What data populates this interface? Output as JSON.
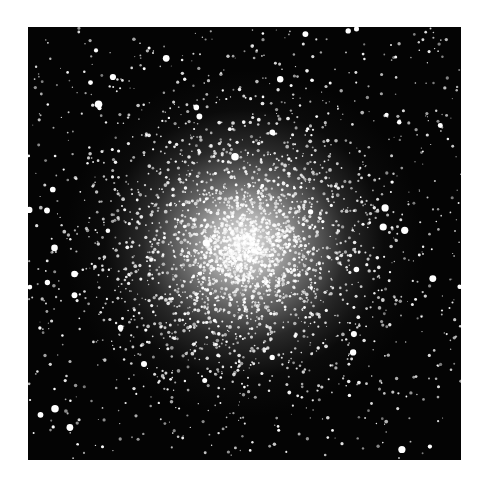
{
  "image": {
    "subject": "globular star cluster",
    "description": "Dense spherical cluster of white stars on a black sky, brightest and most crowded at the center, thinning outward",
    "background_color": "#ffffff",
    "sky_color": "#040404",
    "core_color": "#ebebeb",
    "frame": {
      "left": 28,
      "top": 27,
      "width": 433,
      "height": 433
    }
  }
}
